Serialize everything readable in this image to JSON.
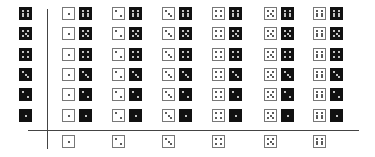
{
  "row_header_black_dice": [
    6,
    5,
    4,
    3,
    2,
    1
  ],
  "column_header_white_dice": [
    1,
    2,
    3,
    4,
    5,
    6
  ],
  "cells": [
    [
      [
        1,
        6
      ],
      [
        2,
        6
      ],
      [
        3,
        6
      ],
      [
        4,
        6
      ],
      [
        5,
        6
      ],
      [
        6,
        6
      ]
    ],
    [
      [
        1,
        5
      ],
      [
        2,
        5
      ],
      [
        3,
        5
      ],
      [
        4,
        5
      ],
      [
        5,
        5
      ],
      [
        6,
        5
      ]
    ],
    [
      [
        1,
        4
      ],
      [
        2,
        4
      ],
      [
        3,
        4
      ],
      [
        4,
        4
      ],
      [
        5,
        4
      ],
      [
        6,
        4
      ]
    ],
    [
      [
        1,
        3
      ],
      [
        2,
        3
      ],
      [
        3,
        3
      ],
      [
        4,
        3
      ],
      [
        5,
        3
      ],
      [
        6,
        3
      ]
    ],
    [
      [
        1,
        2
      ],
      [
        2,
        2
      ],
      [
        3,
        2
      ],
      [
        4,
        2
      ],
      [
        5,
        2
      ],
      [
        6,
        2
      ]
    ],
    [
      [
        1,
        1
      ],
      [
        2,
        1
      ],
      [
        3,
        1
      ],
      [
        4,
        1
      ],
      [
        5,
        1
      ],
      [
        6,
        1
      ]
    ]
  ],
  "colors": {
    "white_die": "#ffffff",
    "black_die": "#111111",
    "grid_line": "#444444"
  }
}
